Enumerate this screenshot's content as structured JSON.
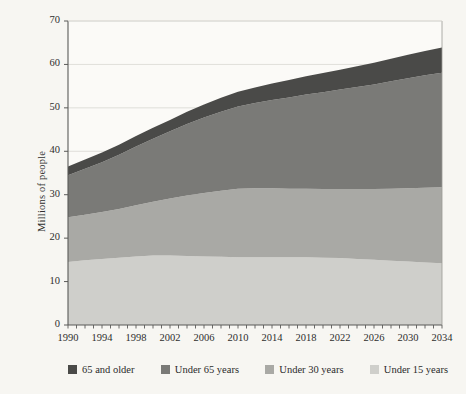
{
  "chart_data": {
    "type": "area",
    "stacked": true,
    "title": "",
    "xlabel": "",
    "ylabel": "Millions of people",
    "xlim": [
      1990,
      2034
    ],
    "ylim": [
      0,
      70
    ],
    "yticks": [
      0,
      10,
      20,
      30,
      40,
      50,
      60,
      70
    ],
    "xticks_labeled": [
      1990,
      1994,
      1998,
      2002,
      2006,
      2010,
      2014,
      2018,
      2022,
      2026,
      2030,
      2034
    ],
    "xtick_interval_minor": 1,
    "grid": "horizontal",
    "legend_position": "bottom",
    "x": [
      1990,
      1992,
      1994,
      1996,
      1998,
      2000,
      2002,
      2004,
      2006,
      2008,
      2010,
      2012,
      2014,
      2016,
      2018,
      2020,
      2022,
      2024,
      2026,
      2028,
      2030,
      2032,
      2034
    ],
    "series": [
      {
        "name": "Under 15 years",
        "color": "#cfcfcb",
        "values": [
          14.5,
          14.9,
          15.2,
          15.5,
          15.8,
          16.0,
          16.0,
          15.9,
          15.8,
          15.7,
          15.6,
          15.6,
          15.6,
          15.6,
          15.6,
          15.5,
          15.4,
          15.2,
          15.0,
          14.8,
          14.6,
          14.4,
          14.2
        ]
      },
      {
        "name": "Under 30 years",
        "color": "#a9a9a5",
        "values": [
          10.3,
          10.5,
          10.8,
          11.2,
          11.8,
          12.4,
          13.1,
          13.9,
          14.6,
          15.2,
          15.8,
          15.9,
          15.9,
          15.8,
          15.8,
          15.8,
          15.9,
          16.1,
          16.3,
          16.6,
          16.9,
          17.2,
          17.5
        ]
      },
      {
        "name": "Under 65 years",
        "color": "#7a7a77",
        "values": [
          9.7,
          10.6,
          11.5,
          12.5,
          13.5,
          14.5,
          15.5,
          16.5,
          17.4,
          18.2,
          18.9,
          19.6,
          20.3,
          21.0,
          21.7,
          22.3,
          22.9,
          23.5,
          24.1,
          24.7,
          25.3,
          25.9,
          26.4
        ]
      },
      {
        "name": "65 and older",
        "color": "#4a4a48",
        "values": [
          2.0,
          2.1,
          2.2,
          2.3,
          2.4,
          2.5,
          2.6,
          2.8,
          3.0,
          3.2,
          3.4,
          3.6,
          3.8,
          4.0,
          4.2,
          4.4,
          4.6,
          4.8,
          5.0,
          5.2,
          5.4,
          5.6,
          5.8
        ]
      }
    ],
    "totals": [
      36.5,
      38.1,
      39.7,
      41.5,
      43.5,
      45.4,
      47.2,
      49.1,
      50.8,
      52.3,
      53.7,
      54.7,
      55.6,
      56.4,
      57.3,
      58.0,
      58.8,
      59.6,
      60.4,
      61.3,
      62.2,
      63.1,
      63.9
    ]
  },
  "legend": {
    "items": [
      {
        "label": "65 and older",
        "color": "#4a4a48"
      },
      {
        "label": "Under 65 years",
        "color": "#7a7a77"
      },
      {
        "label": "Under 30 years",
        "color": "#a9a9a5"
      },
      {
        "label": "Under 15 years",
        "color": "#cfcfcb"
      }
    ]
  },
  "axes": {
    "y_title": "Millions of people"
  }
}
